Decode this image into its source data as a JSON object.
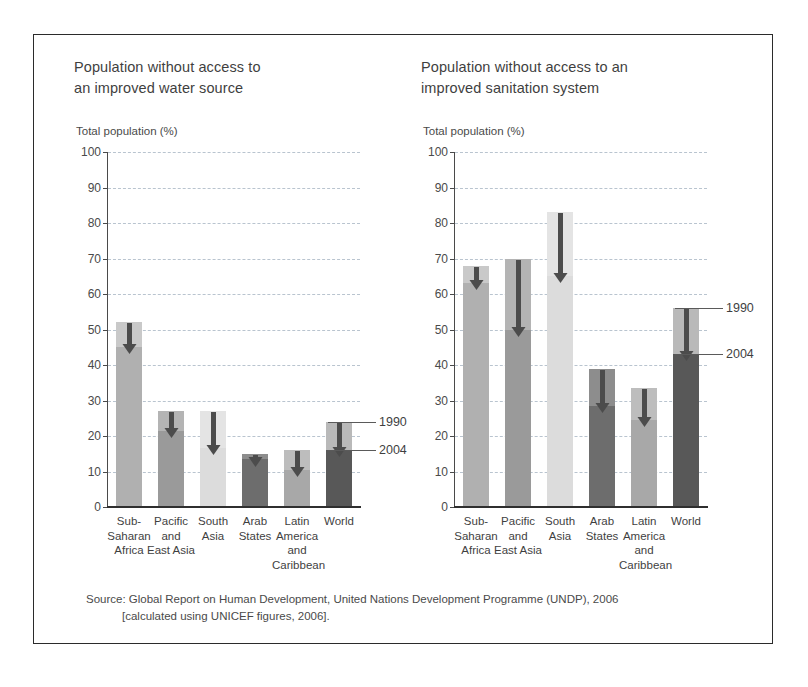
{
  "figure": {
    "source_line1": "Source: Global Report on Human Development, United Nations Development Programme (UNDP), 2006",
    "source_line2": "[calculated using UNICEF figures, 2006]."
  },
  "legend": {
    "first_label": "1990",
    "second_label": "2004"
  },
  "chart_data": [
    {
      "type": "bar",
      "id": "water",
      "title": "Population without access to an improved water source",
      "title_line1": "Population without access to",
      "title_line2": "an improved water source",
      "ylabel": "Total population (%)",
      "xlabel": "",
      "ylim": [
        0,
        100
      ],
      "yticks": [
        0,
        10,
        20,
        30,
        40,
        50,
        60,
        70,
        80,
        90,
        100
      ],
      "grid": true,
      "legend_position": "right-of-world-bar",
      "categories": [
        "Sub-Saharan Africa",
        "Pacific and East Asia",
        "South Asia",
        "Arab States",
        "Latin America and Caribbean",
        "World"
      ],
      "category_lines": [
        [
          "Sub-",
          "Saharan",
          "Africa"
        ],
        [
          "Pacific",
          "and",
          "East Asia"
        ],
        [
          "South",
          "Asia"
        ],
        [
          "Arab",
          "States"
        ],
        [
          "Latin",
          "America",
          "and",
          "Caribbean"
        ],
        [
          "World"
        ]
      ],
      "series": [
        {
          "name": "1990",
          "values": [
            52,
            27,
            27,
            15,
            16,
            24
          ]
        },
        {
          "name": "2004",
          "values": [
            45,
            21.5,
            16.5,
            13.5,
            10.5,
            16
          ]
        }
      ],
      "bar_colors": [
        "#b0b0b0",
        "#9a9a9a",
        "#dcdcdc",
        "#6d6d6d",
        "#a8a8a8",
        "#585858"
      ],
      "top_segment_colors": [
        "#c9c9c9",
        "#b4b4b4",
        "#e4e4e4",
        "#8d8d8d",
        "#bdbdbd",
        "#b9b9b9"
      ]
    },
    {
      "type": "bar",
      "id": "sanitation",
      "title": "Population without access to an improved sanitation system",
      "title_line1": "Population without access to an",
      "title_line2": "improved sanitation system",
      "ylabel": "Total population (%)",
      "xlabel": "",
      "ylim": [
        0,
        100
      ],
      "yticks": [
        0,
        10,
        20,
        30,
        40,
        50,
        60,
        70,
        80,
        90,
        100
      ],
      "grid": true,
      "legend_position": "right-of-world-bar",
      "categories": [
        "Sub-Saharan Africa",
        "Pacific and East Asia",
        "South Asia",
        "Arab States",
        "Latin America and Caribbean",
        "World"
      ],
      "category_lines": [
        [
          "Sub-",
          "Saharan",
          "Africa"
        ],
        [
          "Pacific",
          "and",
          "East Asia"
        ],
        [
          "South",
          "Asia"
        ],
        [
          "Arab",
          "States"
        ],
        [
          "Latin",
          "America",
          "and",
          "Caribbean"
        ],
        [
          "World"
        ]
      ],
      "series": [
        {
          "name": "1990",
          "values": [
            68,
            70,
            83,
            39,
            33.5,
            56
          ]
        },
        {
          "name": "2004",
          "values": [
            63,
            50,
            65,
            28.5,
            24.5,
            43
          ]
        }
      ],
      "bar_colors": [
        "#b0b0b0",
        "#9a9a9a",
        "#dcdcdc",
        "#6d6d6d",
        "#a8a8a8",
        "#585858"
      ],
      "top_segment_colors": [
        "#c9c9c9",
        "#b4b4b4",
        "#e4e4e4",
        "#8d8d8d",
        "#bdbdbd",
        "#b9b9b9"
      ]
    }
  ]
}
